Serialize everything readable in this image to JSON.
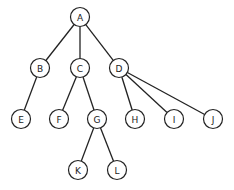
{
  "diagram": {
    "type": "tree",
    "colors": {
      "stroke": "#222222",
      "fill": "#ffffff",
      "text": "#222222"
    },
    "node_radius": 9.5,
    "nodes": [
      {
        "id": "A",
        "label": "A",
        "x": 80,
        "y": 17
      },
      {
        "id": "B",
        "label": "B",
        "x": 40,
        "y": 68
      },
      {
        "id": "C",
        "label": "C",
        "x": 80,
        "y": 68
      },
      {
        "id": "D",
        "label": "D",
        "x": 119,
        "y": 68
      },
      {
        "id": "E",
        "label": "E",
        "x": 21,
        "y": 119
      },
      {
        "id": "F",
        "label": "F",
        "x": 59,
        "y": 119
      },
      {
        "id": "G",
        "label": "G",
        "x": 97,
        "y": 119
      },
      {
        "id": "H",
        "label": "H",
        "x": 135,
        "y": 119
      },
      {
        "id": "I",
        "label": "I",
        "x": 174,
        "y": 119
      },
      {
        "id": "J",
        "label": "J",
        "x": 213,
        "y": 119
      },
      {
        "id": "K",
        "label": "K",
        "x": 78,
        "y": 170
      },
      {
        "id": "L",
        "label": "L",
        "x": 117,
        "y": 170
      }
    ],
    "edges": [
      {
        "from": "A",
        "to": "B"
      },
      {
        "from": "A",
        "to": "C"
      },
      {
        "from": "A",
        "to": "D"
      },
      {
        "from": "B",
        "to": "E"
      },
      {
        "from": "C",
        "to": "F"
      },
      {
        "from": "C",
        "to": "G"
      },
      {
        "from": "D",
        "to": "H"
      },
      {
        "from": "D",
        "to": "I"
      },
      {
        "from": "D",
        "to": "J"
      },
      {
        "from": "G",
        "to": "K"
      },
      {
        "from": "G",
        "to": "L"
      }
    ]
  }
}
